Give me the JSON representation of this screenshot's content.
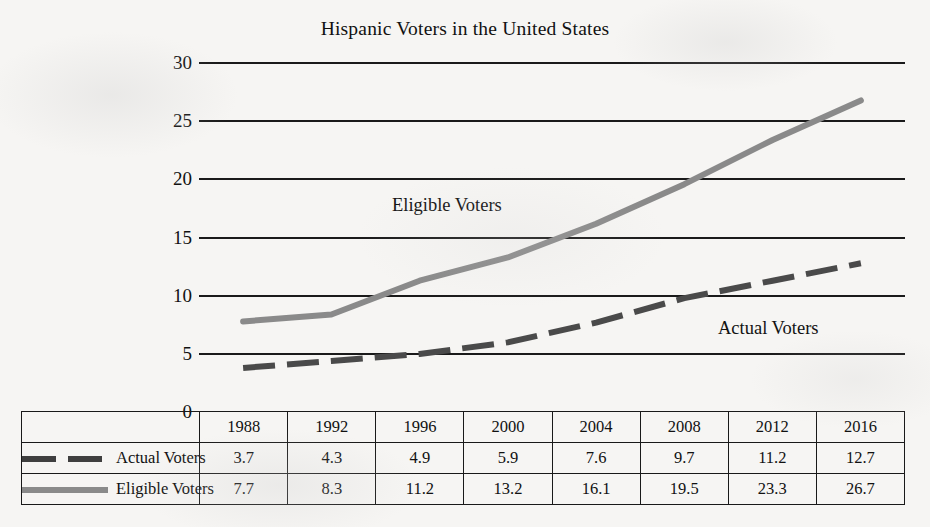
{
  "chart_data": {
    "type": "line",
    "title": "Hispanic Voters in the United States",
    "xlabel": "",
    "ylabel": "",
    "categories": [
      "1988",
      "1992",
      "1996",
      "2000",
      "2004",
      "2008",
      "2012",
      "2016"
    ],
    "series": [
      {
        "name": "Actual Voters",
        "values": [
          3.7,
          4.3,
          4.9,
          5.9,
          7.6,
          9.7,
          11.2,
          12.7
        ],
        "color": "#4a4a4a",
        "style": "dashed"
      },
      {
        "name": "Eligible Voters",
        "values": [
          7.7,
          8.3,
          11.2,
          13.2,
          16.1,
          19.5,
          23.3,
          26.7
        ],
        "color": "#8a8a8a",
        "style": "solid"
      }
    ],
    "ylim": [
      0,
      30
    ],
    "y_ticks": [
      "0",
      "5",
      "10",
      "15",
      "20",
      "25",
      "30"
    ],
    "grid": true,
    "legend_position": "bottom-table",
    "annotations": [
      {
        "text": "Eligible Voters",
        "series": "Eligible Voters"
      },
      {
        "text": "Actual Voters",
        "series": "Actual Voters"
      }
    ]
  },
  "table": {
    "header_corner": "",
    "year_headers": [
      "1988",
      "1992",
      "1996",
      "2000",
      "2004",
      "2008",
      "2012",
      "2016"
    ],
    "rows": [
      {
        "label": "Actual Voters",
        "swatch": "dashed-line-swatch",
        "cells": [
          "3.7",
          "4.3",
          "4.9",
          "5.9",
          "7.6",
          "9.7",
          "11.2",
          "12.7"
        ]
      },
      {
        "label": "Eligible Voters",
        "swatch": "solid-line-swatch",
        "cells": [
          "7.7",
          "8.3",
          "11.2",
          "13.2",
          "16.1",
          "19.5",
          "23.3",
          "26.7"
        ]
      }
    ]
  },
  "colors": {
    "background": "#f6f5f3",
    "ink": "#111111",
    "grid": "#1a1a1a",
    "actual_voters": "#4a4a4a",
    "eligible_voters": "#8a8a8a"
  }
}
